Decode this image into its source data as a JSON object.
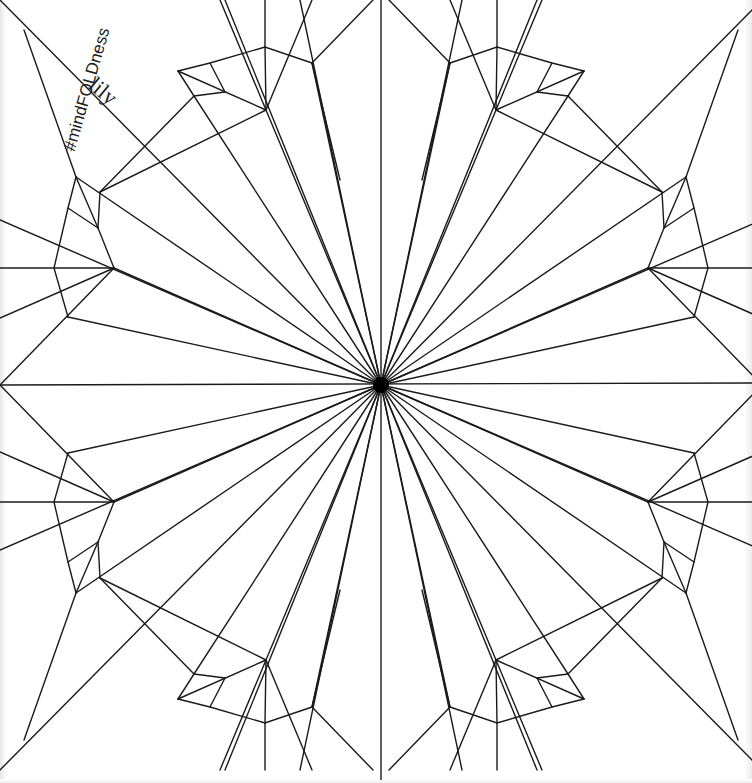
{
  "diagram": {
    "type": "origami crease pattern",
    "subject": "lily",
    "stroke_color": "#1a1a1a",
    "background": "#ffffff",
    "center": [
      381,
      385
    ],
    "symmetry": "mirror across vertical x=381 and horizontal y=385",
    "quadrant_top_left": {
      "flap_top": {
        "A": [
          178,
          71
        ],
        "F": [
          210,
          63
        ],
        "B": [
          265,
          47
        ],
        "G": [
          312,
          63
        ],
        "D": [
          194,
          96
        ],
        "E": [
          225,
          92
        ],
        "C": [
          266,
          110
        ]
      },
      "flap_left": {
        "P1": [
          76,
          177
        ],
        "P2": [
          100,
          192
        ],
        "P3": [
          98,
          228
        ],
        "P4": [
          68,
          208
        ],
        "P5": [
          54,
          268
        ],
        "H": [
          114,
          268
        ],
        "P6": [
          68,
          317
        ]
      }
    }
  },
  "labels": {
    "hashtag": "#mindFOLDness",
    "title": "lily"
  }
}
